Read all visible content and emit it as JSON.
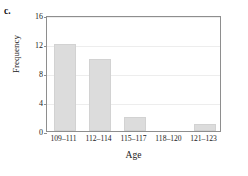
{
  "figure": {
    "panel_letter": "c."
  },
  "chart_data": {
    "type": "bar",
    "title": "",
    "subtitle": "",
    "categories": [
      "109–111",
      "112–114",
      "115–117",
      "118–120",
      "121–123"
    ],
    "values": [
      12,
      10,
      2,
      0,
      1
    ],
    "xlabel": "Age",
    "ylabel": "Frequency",
    "ylim": [
      0,
      16
    ],
    "yticks": [
      0,
      4,
      8,
      12,
      16
    ],
    "ytick_labels": [
      "0",
      "4",
      "8",
      "12",
      "16"
    ],
    "grid": "horizontal",
    "legend": "none",
    "bar_color": "#dcdcdc",
    "grid_color": "#ededed",
    "axis_color": "#8e8e8e",
    "annotations": []
  }
}
